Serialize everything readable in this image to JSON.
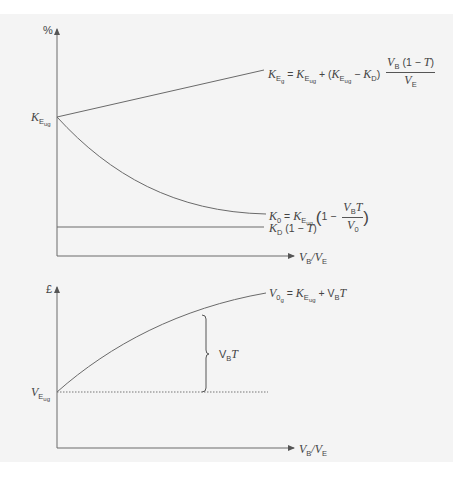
{
  "top_chart": {
    "y_axis_label": "%",
    "x_axis_label": {
      "v1": "V",
      "s1": "B",
      "slash": "/",
      "v2": "V",
      "s2": "E"
    },
    "origin_label": {
      "k": "K",
      "s": "E",
      "ss": "ug"
    },
    "lines": {
      "keg": {
        "lhs_k": "K",
        "lhs_s": "E",
        "lhs_ss": "g",
        "eq": "=",
        "t1_k": "K",
        "t1_s": "E",
        "t1_ss": "ug",
        "plus": "+ (",
        "t2_k": "K",
        "t2_s": "E",
        "t2_ss": "ug",
        "minus": "−",
        "t3_k": "K",
        "t3_s": "D",
        "close": ")",
        "num_v": "V",
        "num_s": "B",
        "num_rest": " (1 − ",
        "num_t": "T",
        "num_close": ")",
        "den_v": "V",
        "den_s": "E"
      },
      "k0": {
        "lhs_k": "K",
        "lhs_s": "0",
        "eq": "=",
        "t1_k": "K",
        "t1_s": "E",
        "t1_ss": "ug",
        "open": "(",
        "one_minus": "1 −",
        "num_v": "V",
        "num_s": "B",
        "num_t": "T",
        "den_v": "V",
        "den_s": "0",
        "close": ")"
      },
      "kd": {
        "k": "K",
        "s": "D",
        "rest": " (1 − ",
        "t": "T",
        "close": ")"
      }
    }
  },
  "bottom_chart": {
    "y_axis_label": "£",
    "x_axis_label": {
      "v1": "V",
      "s1": "B",
      "slash": "/",
      "v2": "V",
      "s2": "E"
    },
    "origin_label": {
      "v": "V",
      "s": "E",
      "ss": "ug"
    },
    "curve_label": {
      "lhs_v": "V",
      "lhs_s": "0",
      "lhs_ss": "g",
      "eq": "=",
      "t1_k": "K",
      "t1_s": "E",
      "t1_ss": "ug",
      "plus": "+ V",
      "plus_s": "B",
      "t": "T"
    },
    "brace_label": {
      "v": "V",
      "s": "B",
      "t": "T"
    }
  },
  "colors": {
    "panel": "#f4f4f4",
    "line": "#6a6a6a",
    "text": "#444444"
  }
}
